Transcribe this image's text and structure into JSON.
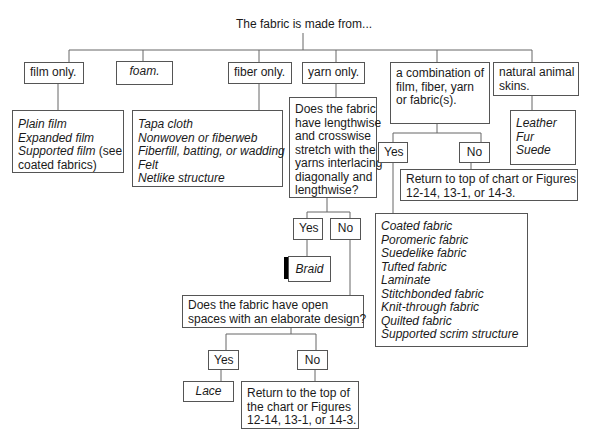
{
  "title": "The fabric is made from...",
  "level1": {
    "film": "film only.",
    "foam": "foam.",
    "fiber": "fiber only.",
    "yarn": "yarn only.",
    "combination": [
      "a combination of",
      "film, fiber, yarn",
      "or fabric(s)."
    ],
    "skins": [
      "natural animal",
      "skins."
    ]
  },
  "film_items": {
    "lines": [
      "Plain film",
      "Expanded film"
    ],
    "supported_italic": "Supported film",
    "supported_rest": " (see",
    "supported_line2": "coated fabrics)"
  },
  "fiber_items": [
    "Tapa cloth",
    "Nonwoven or fiberweb",
    "Fiberfill, batting, or wadding",
    "Felt",
    "Netlike structure"
  ],
  "skins_items": [
    "Leather",
    "Fur",
    "Suede"
  ],
  "yarn_question": [
    "Does the fabric",
    "have lengthwise",
    "and crosswise",
    "stretch with the",
    "yarns interlacing",
    "diagonally and",
    "lengthwise?"
  ],
  "yarn_answers": {
    "yes": "Yes",
    "no": "No",
    "yes_result": "Braid"
  },
  "open_question": [
    "Does the fabric have open",
    "spaces with an elaborate design?"
  ],
  "open_answers": {
    "yes": "Yes",
    "no": "No",
    "yes_result": "Lace",
    "no_result": [
      "Return to the top of",
      "the chart or Figures",
      "12-14, 13-1, or 14-3."
    ]
  },
  "combo_answers": {
    "yes": "Yes",
    "no": "No",
    "no_result": [
      "Return to top of chart or Figures",
      "12-14, 13-1, or 14-3."
    ]
  },
  "combo_items": [
    "Coated fabric",
    "Poromeric fabric",
    "Suedelike fabric",
    "Tufted fabric",
    "Laminate",
    "Stitchbonded fabric",
    "Knit-through fabric",
    "Quilted fabric",
    "Supported scrim structure"
  ],
  "colors": {
    "line": "#555555",
    "text": "#1a1a1a",
    "shadow": "#000000"
  }
}
